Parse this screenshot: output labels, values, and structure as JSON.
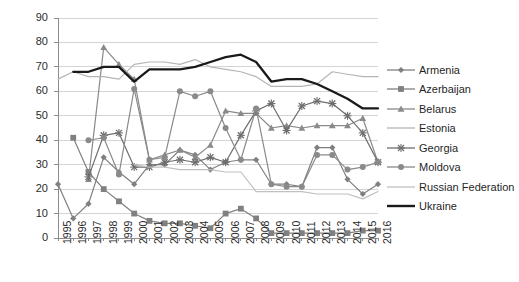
{
  "chart_data": {
    "type": "line",
    "title": "",
    "xlabel": "",
    "ylabel": "",
    "ylim": [
      0,
      90
    ],
    "ytick_step": 10,
    "grid": true,
    "legend_position": "right",
    "yticks": [
      "90",
      "80",
      "70",
      "60",
      "50",
      "40",
      "30",
      "20",
      "10",
      "0"
    ],
    "categories": [
      "1995",
      "1996",
      "1997",
      "1998",
      "1999",
      "2000",
      "2001",
      "2002",
      "2003",
      "2004",
      "2005",
      "2006",
      "2007",
      "2008",
      "2009",
      "2010",
      "2011",
      "2012",
      "2013",
      "2014",
      "2015",
      "2016"
    ],
    "series": [
      {
        "name": "Armenia",
        "marker": "diamond",
        "color": "#808080",
        "values": [
          22,
          8,
          14,
          33,
          27,
          22,
          30,
          30,
          36,
          34,
          28,
          31,
          32,
          32,
          22,
          22,
          21,
          37,
          37,
          24,
          18,
          22
        ]
      },
      {
        "name": "Azerbaijan",
        "marker": "square",
        "color": "#808080",
        "values": [
          null,
          41,
          27,
          20,
          15,
          10,
          7,
          6,
          6,
          5,
          4,
          10,
          12,
          8,
          2,
          2,
          2,
          2,
          2,
          2,
          3,
          3
        ]
      },
      {
        "name": "Belarus",
        "marker": "triangle",
        "color": "#8a8a8a",
        "values": [
          null,
          null,
          24,
          78,
          71,
          65,
          32,
          34,
          36,
          33,
          38,
          52,
          51,
          51,
          45,
          46,
          45,
          46,
          46,
          46,
          49,
          31
        ]
      },
      {
        "name": "Estonia",
        "marker": "none",
        "color": "#b5b5b5",
        "values": [
          65,
          68,
          66,
          66,
          65,
          71,
          72,
          72,
          71,
          73,
          70,
          69,
          68,
          66,
          62,
          62,
          62,
          63,
          68,
          67,
          66,
          66
        ]
      },
      {
        "name": "Georgia",
        "marker": "x",
        "color": "#6e6e6e",
        "values": [
          null,
          null,
          25,
          42,
          43,
          29,
          29,
          31,
          32,
          31,
          33,
          31,
          42,
          52,
          55,
          44,
          54,
          56,
          55,
          50,
          43,
          31
        ]
      },
      {
        "name": "Moldova",
        "marker": "circle",
        "color": "#8a8a8a",
        "values": [
          null,
          null,
          40,
          41,
          26,
          61,
          32,
          33,
          60,
          58,
          60,
          45,
          32,
          53,
          22,
          21,
          21,
          34,
          34,
          28,
          29,
          31
        ]
      },
      {
        "name": "Russian Federation",
        "marker": "none",
        "color": "#c0c0c0",
        "values": [
          null,
          null,
          null,
          null,
          null,
          30,
          29,
          29,
          28,
          28,
          28,
          27,
          27,
          19,
          19,
          19,
          19,
          18,
          18,
          18,
          16,
          19
        ]
      },
      {
        "name": "Ukraine",
        "marker": "none",
        "color": "#1a1a1a",
        "values": [
          null,
          68,
          68,
          70,
          70,
          64,
          69,
          69,
          69,
          70,
          72,
          74,
          75,
          72,
          64,
          65,
          65,
          63,
          60,
          57,
          53,
          53
        ]
      }
    ]
  }
}
